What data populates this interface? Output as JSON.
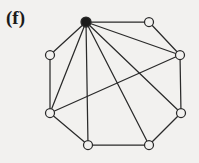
{
  "figure": {
    "label": "(f)",
    "background_color": "#f2f1ef",
    "stroke_color": "#2a2a2a",
    "vertex_fill": "#f2f1ef",
    "hub_fill": "#1b1b1b"
  },
  "chart_data": {
    "type": "diagram",
    "subtype": "undirected-graph",
    "title": "(f)",
    "xlabel": "",
    "ylabel": "",
    "grid": false,
    "legend": false,
    "node_count": 8,
    "edge_count": 14,
    "nodes": [
      {
        "id": "v0",
        "label": "",
        "x": 86,
        "y": 22,
        "r": 5.0,
        "filled": true
      },
      {
        "id": "v1",
        "label": "",
        "x": 149,
        "y": 22,
        "r": 4.5,
        "filled": false
      },
      {
        "id": "v2",
        "label": "",
        "x": 180,
        "y": 55,
        "r": 4.5,
        "filled": false
      },
      {
        "id": "v3",
        "label": "",
        "x": 181,
        "y": 113,
        "r": 4.5,
        "filled": false
      },
      {
        "id": "v4",
        "label": "",
        "x": 149,
        "y": 145,
        "r": 4.5,
        "filled": false
      },
      {
        "id": "v5",
        "label": "",
        "x": 88,
        "y": 145,
        "r": 4.5,
        "filled": false
      },
      {
        "id": "v6",
        "label": "",
        "x": 50,
        "y": 113,
        "r": 4.5,
        "filled": false
      },
      {
        "id": "v7",
        "label": "",
        "x": 50,
        "y": 55,
        "r": 4.5,
        "filled": false
      }
    ],
    "edges": [
      {
        "from": "v0",
        "to": "v1"
      },
      {
        "from": "v0",
        "to": "v2"
      },
      {
        "from": "v0",
        "to": "v3"
      },
      {
        "from": "v0",
        "to": "v4"
      },
      {
        "from": "v0",
        "to": "v5"
      },
      {
        "from": "v0",
        "to": "v6"
      },
      {
        "from": "v0",
        "to": "v7"
      },
      {
        "from": "v1",
        "to": "v2"
      },
      {
        "from": "v2",
        "to": "v3"
      },
      {
        "from": "v2",
        "to": "v6"
      },
      {
        "from": "v3",
        "to": "v4"
      },
      {
        "from": "v4",
        "to": "v5"
      },
      {
        "from": "v5",
        "to": "v6"
      },
      {
        "from": "v6",
        "to": "v7"
      }
    ]
  }
}
